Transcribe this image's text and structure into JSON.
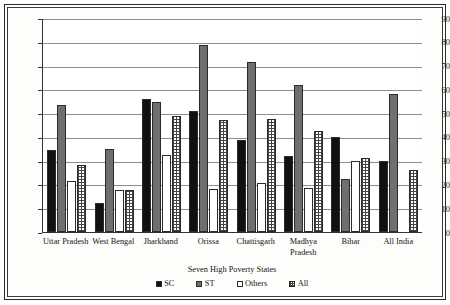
{
  "chart_data": {
    "type": "bar",
    "title": "",
    "xlabel": "Seven High Poverty States",
    "ylabel": "",
    "ylim": [
      0,
      90
    ],
    "ytick_step": 10,
    "yticks": [
      90,
      80,
      70,
      60,
      50,
      40,
      30,
      20,
      10,
      0
    ],
    "grid": true,
    "legend_position": "bottom",
    "categories": [
      "Uttar Pradesh",
      "West Bengal",
      "Jharkhand",
      "Orissa",
      "Chattisgarh",
      "Madhya Pradesh",
      "Bihar",
      "All India"
    ],
    "series": [
      {
        "name": "SC",
        "color": "#111111",
        "pattern": "solid-black",
        "values": [
          34.5,
          12,
          56,
          51,
          38.5,
          32,
          40,
          30
        ]
      },
      {
        "name": "ST",
        "color": "#6f6f6f",
        "pattern": "solid-gray",
        "values": [
          53.5,
          35,
          54.5,
          78.5,
          71.5,
          62,
          22.5,
          58
        ]
      },
      {
        "name": "Others",
        "color": "#ffffff",
        "pattern": "open-white",
        "values": [
          21.5,
          17.5,
          32.5,
          18,
          20.5,
          18.5,
          30,
          0
        ]
      },
      {
        "name": "All",
        "color": "#ffffff",
        "pattern": "checkered-hatch",
        "values": [
          28,
          17.5,
          49,
          47,
          47.5,
          42.5,
          31,
          26
        ]
      }
    ]
  },
  "axis": {
    "x_title": "Seven High Poverty States"
  }
}
